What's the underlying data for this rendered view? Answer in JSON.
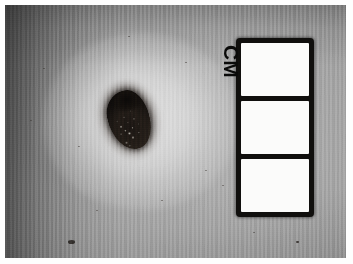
{
  "page": {
    "background_color": "#ffffff",
    "width": 353,
    "height": 264
  },
  "photograph": {
    "name": "clinical-skin-lesion-photograph",
    "type": "grayscale-clinical-photo",
    "subject": "pigmented skin lesion with measurement scale",
    "bounds": {
      "x": 5,
      "y": 5,
      "width": 341,
      "height": 253
    },
    "background_color": "#a6a6a6",
    "vignette": "darker along left and top-left edges, brighter toward centre-right"
  },
  "lesion": {
    "name": "pigmented-lesion",
    "label": "",
    "color": "#16110e",
    "bounds": {
      "x": 106,
      "y": 88,
      "width": 46,
      "height": 64
    },
    "shape": "irregular oval, long axis tilted ~13 degrees counter-clockwise",
    "features": "dark near-black pigment with light speckled granular mottling in the lower half",
    "halo": "bright depigmented-looking ring of illuminated skin surrounding the lesion"
  },
  "scale_card": {
    "name": "cm-scale-card",
    "unit_label": "CM",
    "unit_label_rotation_degrees": 90,
    "border_color": "#100f0d",
    "cell_color": "#fbfbfa",
    "bounds": {
      "x": 236,
      "y": 38,
      "width": 78,
      "height": 179
    },
    "cells": [
      {
        "label": "CM",
        "has_label": true
      },
      {
        "label": "",
        "has_label": false
      },
      {
        "label": "",
        "has_label": false
      }
    ]
  },
  "skin_specks": [
    {
      "name": "skin-speck-1",
      "x": 185,
      "y": 62,
      "size": 2.4,
      "prominent": false
    },
    {
      "name": "skin-speck-2",
      "x": 43,
      "y": 68,
      "size": 2.0,
      "prominent": false
    },
    {
      "name": "skin-speck-3",
      "x": 78,
      "y": 146,
      "size": 2.2,
      "prominent": false
    },
    {
      "name": "skin-speck-4",
      "x": 205,
      "y": 170,
      "size": 2.0,
      "prominent": false
    },
    {
      "name": "skin-speck-5",
      "x": 222,
      "y": 185,
      "size": 1.8,
      "prominent": false
    },
    {
      "name": "skin-speck-6",
      "x": 161,
      "y": 200,
      "size": 1.6,
      "prominent": false
    },
    {
      "name": "skin-speck-7",
      "x": 96,
      "y": 210,
      "size": 1.6,
      "prominent": false
    },
    {
      "name": "skin-speck-8",
      "x": 68,
      "y": 240,
      "size": 6.5,
      "prominent": true
    },
    {
      "name": "skin-speck-9",
      "x": 296,
      "y": 241,
      "size": 3.0,
      "prominent": true
    },
    {
      "name": "skin-speck-10",
      "x": 253,
      "y": 232,
      "size": 1.8,
      "prominent": false
    },
    {
      "name": "skin-speck-11",
      "x": 128,
      "y": 36,
      "size": 1.8,
      "prominent": false
    },
    {
      "name": "skin-speck-12",
      "x": 30,
      "y": 120,
      "size": 1.8,
      "prominent": false
    }
  ]
}
